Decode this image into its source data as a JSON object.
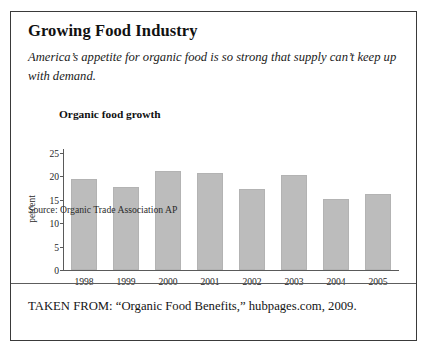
{
  "figure": {
    "title": "Growing Food Industry",
    "subtitle": "America’s appetite for organic food is so strong that supply can’t keep up with demand.",
    "source_note": "Source: Organic Trade Association AP",
    "taken_from": "TAKEN FROM: “Organic Food Benefits,” hubpages.com, 2009.",
    "bar_color": "#bcbcbc",
    "border_color": "#3a3a3a",
    "text_color": "#1a1a1a"
  },
  "chart_data": {
    "type": "bar",
    "title": "Organic food growth",
    "xlabel": "",
    "ylabel": "percent",
    "categories": [
      "1998",
      "1999",
      "2000",
      "2001",
      "2002",
      "2003",
      "2004",
      "2005"
    ],
    "values": [
      19.4,
      17.7,
      21.2,
      20.8,
      17.4,
      20.3,
      15.2,
      16.2
    ],
    "ylim": [
      0,
      25
    ],
    "yticks": [
      0,
      5,
      10,
      15,
      20,
      25
    ],
    "ytick_labels": [
      "0",
      "5",
      "10",
      "15",
      "20",
      "25"
    ],
    "grid": false,
    "legend": "none",
    "series": [
      {
        "name": "Organic food growth",
        "values": [
          19.4,
          17.7,
          21.2,
          20.8,
          17.4,
          20.3,
          15.2,
          16.2
        ]
      }
    ]
  }
}
